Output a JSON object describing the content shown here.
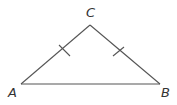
{
  "diagram": {
    "type": "isosceles-triangle",
    "stroke_color": "#555555",
    "label_color": "#333333",
    "vertices": [
      {
        "name": "A",
        "x": 21,
        "y": 84,
        "label": "A",
        "label_x": 12,
        "label_y": 97
      },
      {
        "name": "B",
        "x": 160,
        "y": 84,
        "label": "B",
        "label_x": 163,
        "label_y": 97
      },
      {
        "name": "C",
        "x": 90,
        "y": 25,
        "label": "C",
        "label_x": 86,
        "label_y": 17
      }
    ],
    "sides": [
      {
        "name": "AC",
        "from": "A",
        "to": "C",
        "tick_marks": 1
      },
      {
        "name": "CB",
        "from": "C",
        "to": "B",
        "tick_marks": 1
      },
      {
        "name": "AB",
        "from": "A",
        "to": "B",
        "tick_marks": 0
      }
    ],
    "congruent_sides": [
      "AC",
      "CB"
    ]
  }
}
